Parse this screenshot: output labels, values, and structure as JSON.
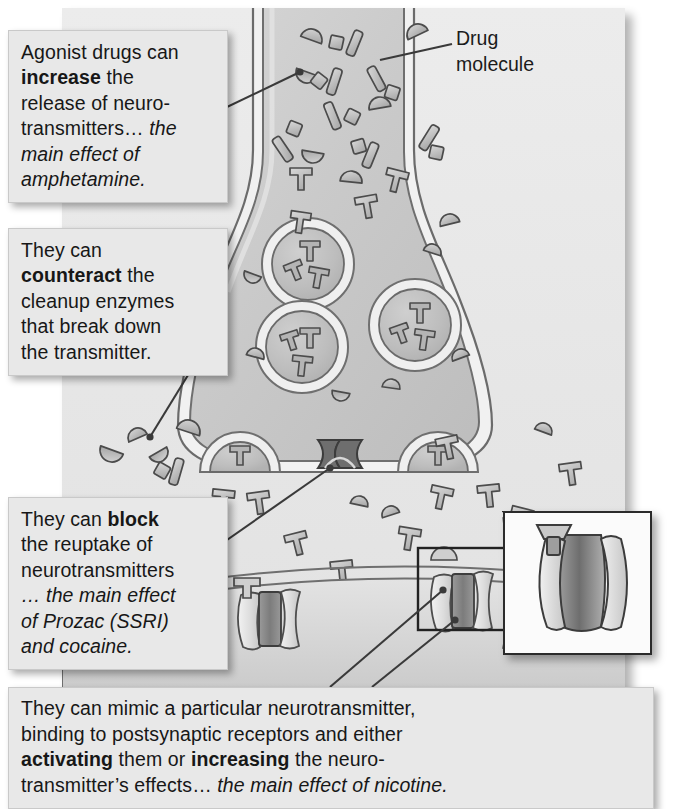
{
  "figure": {
    "panel_color": "#e9e9e9",
    "ink_color": "#4a4a4a"
  },
  "labels": {
    "drug_molecule": {
      "line1": "Drug",
      "line2": "molecule"
    }
  },
  "callouts": [
    {
      "id": "agonist-release",
      "lines": [
        {
          "text": "Agonist drugs can",
          "style": "normal"
        },
        {
          "text": "increase",
          "style": "bold",
          "tail": " the"
        },
        {
          "text": "release of neuro-",
          "style": "normal"
        },
        {
          "text": "transmitters… ",
          "style": "normal",
          "italic_tail": "the"
        },
        {
          "text": "main effect of",
          "style": "italic"
        },
        {
          "text": "amphetamine.",
          "style": "italic"
        }
      ]
    },
    {
      "id": "counteract-enzymes",
      "lines": [
        {
          "text": "They can",
          "style": "normal"
        },
        {
          "text": "counteract",
          "style": "bold",
          "tail": " the"
        },
        {
          "text": "cleanup enzymes",
          "style": "normal"
        },
        {
          "text": "that break down",
          "style": "normal"
        },
        {
          "text": "the transmitter.",
          "style": "normal"
        }
      ]
    },
    {
      "id": "block-reuptake",
      "lines": [
        {
          "text": "They can ",
          "style": "normal",
          "bold_tail": "block"
        },
        {
          "text": "the reuptake of",
          "style": "normal"
        },
        {
          "text": "neurotransmitters",
          "style": "normal"
        },
        {
          "text": "… the main effect",
          "style": "italic"
        },
        {
          "text": "of Prozac (SSRI)",
          "style": "italic"
        },
        {
          "text": "and cocaine.",
          "style": "italic"
        }
      ]
    },
    {
      "id": "mimic-receptors",
      "lines": [
        {
          "text": "They can mimic a particular neurotransmitter,",
          "style": "normal"
        },
        {
          "text": "binding to postsynaptic receptors and either",
          "style": "normal"
        },
        {
          "text": "activating",
          "style": "bold",
          "mid": " them or ",
          "bold2": "increasing",
          "tail": " the neuro-"
        },
        {
          "text": "transmitter’s effects… ",
          "style": "normal",
          "italic_tail": "the main effect of nicotine."
        }
      ]
    }
  ],
  "diagram_parts": {
    "presynaptic_terminal": "axon terminal (bouton)",
    "vesicles": 3,
    "vesicle_contents": "neurotransmitter molecules",
    "free_neurotransmitters": "T-shaped molecules",
    "drug_molecules": "half-circle, square and bar shapes",
    "reuptake_transporter": "bowtie channel in presynaptic membrane",
    "postsynaptic_receptors": 2,
    "inset": "magnified receptor with bound molecule"
  }
}
